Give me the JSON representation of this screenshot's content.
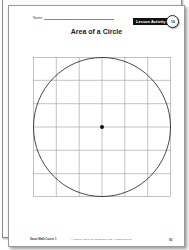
{
  "worksheet": {
    "name_label": "Name",
    "badge": {
      "label": "Lesson Activity",
      "number": "10"
    },
    "title": "Area of a Circle",
    "figure": {
      "grid_rows": 6,
      "grid_cols": 6,
      "shape": "circle",
      "center_dot": true
    },
    "footer": {
      "left": "Saxon Math Course 1",
      "middle": "© Harcourt Achieve Inc. and Stephen Hake. All rights reserved.",
      "page_number": "93"
    }
  },
  "colors": {
    "grid_line": "#9a9a9a",
    "circle_stroke": "#333333",
    "badge_bg": "#111111"
  }
}
